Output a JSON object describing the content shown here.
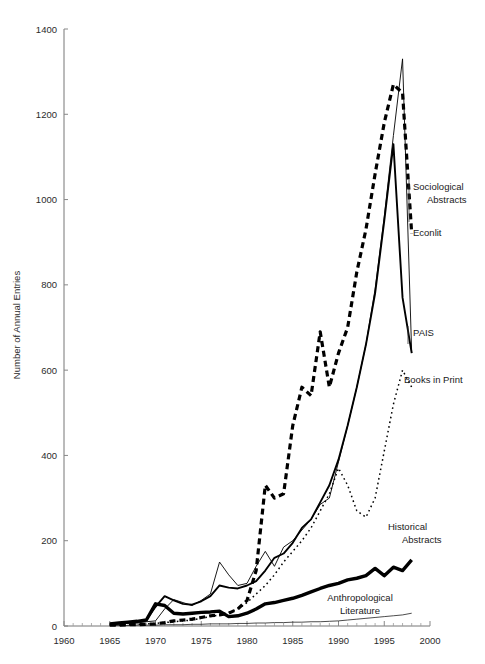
{
  "chart_data": {
    "type": "line",
    "title": "",
    "xlabel": "",
    "ylabel": "Number of Annual Entries",
    "xlim": [
      1960,
      2000
    ],
    "ylim": [
      0,
      1400
    ],
    "grid": false,
    "legend_position": "inline-right-labels",
    "x_ticks": [
      1960,
      1965,
      1970,
      1975,
      1980,
      1985,
      1990,
      1995,
      2000
    ],
    "x_tick_labels": [
      "1960",
      "1965",
      "1970",
      "1975",
      "1980",
      "1985",
      "1990",
      "1995",
      "2000"
    ],
    "x_minor_tick_interval": 1,
    "y_ticks": [
      0,
      200,
      400,
      600,
      800,
      1000,
      1200,
      1400
    ],
    "y_tick_labels": [
      "0",
      "200",
      "400",
      "600",
      "800",
      "1000",
      "1200",
      "1400"
    ],
    "series": [
      {
        "name": "Sociological Abstracts",
        "style": "thin-solid",
        "label_text_lines": [
          "Sociological",
          "Abstracts"
        ],
        "x": [
          1965,
          1966,
          1967,
          1968,
          1969,
          1970,
          1971,
          1972,
          1973,
          1974,
          1975,
          1976,
          1977,
          1978,
          1979,
          1980,
          1981,
          1982,
          1983,
          1984,
          1985,
          1986,
          1987,
          1988,
          1989,
          1990,
          1991,
          1992,
          1993,
          1994,
          1995,
          1996,
          1997,
          1998
        ],
        "values": [
          4,
          5,
          6,
          7,
          10,
          12,
          40,
          62,
          55,
          48,
          60,
          75,
          150,
          120,
          95,
          100,
          140,
          175,
          140,
          185,
          200,
          225,
          250,
          285,
          300,
          385,
          470,
          560,
          660,
          790,
          960,
          1150,
          1330,
          640
        ]
      },
      {
        "name": "Econlit",
        "style": "thick-dashed",
        "label_text_lines": [
          "Econlit"
        ],
        "x": [
          1965,
          1966,
          1967,
          1968,
          1969,
          1970,
          1971,
          1972,
          1973,
          1974,
          1975,
          1976,
          1977,
          1978,
          1979,
          1980,
          1981,
          1982,
          1983,
          1984,
          1985,
          1986,
          1987,
          1988,
          1989,
          1990,
          1991,
          1992,
          1993,
          1994,
          1995,
          1996,
          1997,
          1998
        ],
        "values": [
          2,
          2,
          3,
          3,
          4,
          5,
          8,
          12,
          14,
          16,
          20,
          24,
          26,
          30,
          40,
          60,
          130,
          330,
          300,
          310,
          470,
          560,
          540,
          690,
          560,
          640,
          700,
          830,
          930,
          1060,
          1180,
          1270,
          1250,
          920
        ]
      },
      {
        "name": "PAIS",
        "style": "thin-solid-2",
        "label_text_lines": [
          "PAIS"
        ],
        "x": [
          1965,
          1966,
          1967,
          1968,
          1969,
          1970,
          1971,
          1972,
          1973,
          1974,
          1975,
          1976,
          1977,
          1978,
          1979,
          1980,
          1981,
          1982,
          1983,
          1984,
          1985,
          1986,
          1987,
          1988,
          1989,
          1990,
          1991,
          1992,
          1993,
          1994,
          1995,
          1996,
          1997,
          1998
        ],
        "values": [
          5,
          6,
          8,
          10,
          14,
          45,
          70,
          60,
          52,
          50,
          58,
          70,
          95,
          90,
          88,
          95,
          105,
          130,
          160,
          170,
          195,
          230,
          250,
          290,
          330,
          390,
          470,
          560,
          660,
          780,
          950,
          1130,
          770,
          640
        ]
      },
      {
        "name": "Books in Print",
        "style": "fine-dotted",
        "label_text_lines": [
          "Books in Print"
        ],
        "x": [
          1965,
          1966,
          1967,
          1968,
          1969,
          1970,
          1971,
          1972,
          1973,
          1974,
          1975,
          1976,
          1977,
          1978,
          1979,
          1980,
          1981,
          1982,
          1983,
          1984,
          1985,
          1986,
          1987,
          1988,
          1989,
          1990,
          1991,
          1992,
          1993,
          1994,
          1995,
          1996,
          1997,
          1998
        ],
        "values": [
          2,
          2,
          3,
          4,
          5,
          6,
          8,
          10,
          12,
          14,
          18,
          22,
          26,
          32,
          40,
          55,
          75,
          95,
          120,
          150,
          175,
          200,
          230,
          270,
          310,
          370,
          330,
          270,
          255,
          300,
          410,
          520,
          600,
          560
        ]
      },
      {
        "name": "Historical Abstracts",
        "style": "very-thick-solid",
        "label_text_lines": [
          "Historical",
          "Abstracts"
        ],
        "x": [
          1965,
          1966,
          1967,
          1968,
          1969,
          1970,
          1971,
          1972,
          1973,
          1974,
          1975,
          1976,
          1977,
          1978,
          1979,
          1980,
          1981,
          1982,
          1983,
          1984,
          1985,
          1986,
          1987,
          1988,
          1989,
          1990,
          1991,
          1992,
          1993,
          1994,
          1995,
          1996,
          1997,
          1998
        ],
        "values": [
          5,
          7,
          9,
          11,
          14,
          52,
          48,
          30,
          28,
          30,
          32,
          33,
          35,
          22,
          24,
          30,
          40,
          52,
          55,
          60,
          65,
          72,
          80,
          88,
          95,
          100,
          108,
          112,
          118,
          135,
          118,
          138,
          130,
          155
        ]
      },
      {
        "name": "Anthropological Literature",
        "style": "hairline-solid",
        "label_text_lines": [
          "Anthropological",
          "Literature"
        ],
        "x": [
          1965,
          1966,
          1967,
          1968,
          1969,
          1970,
          1971,
          1972,
          1973,
          1974,
          1975,
          1976,
          1977,
          1978,
          1979,
          1980,
          1981,
          1982,
          1983,
          1984,
          1985,
          1986,
          1987,
          1988,
          1989,
          1990,
          1991,
          1992,
          1993,
          1994,
          1995,
          1996,
          1997,
          1998
        ],
        "values": [
          1,
          1,
          1,
          2,
          2,
          2,
          3,
          3,
          3,
          4,
          4,
          5,
          5,
          5,
          6,
          6,
          7,
          7,
          8,
          8,
          9,
          9,
          10,
          10,
          11,
          12,
          14,
          16,
          18,
          20,
          22,
          24,
          26,
          30
        ]
      }
    ]
  },
  "axes": {
    "y_axis_title": "Number of Annual Entries"
  },
  "annotations": [
    {
      "name": "sociological-abstracts-label",
      "lines": [
        "Sociological",
        "Abstracts"
      ]
    },
    {
      "name": "econlit-label",
      "lines": [
        "Econlit"
      ]
    },
    {
      "name": "pais-label",
      "lines": [
        "PAIS"
      ]
    },
    {
      "name": "books-in-print-label",
      "lines": [
        "Books in Print"
      ]
    },
    {
      "name": "historical-abstracts-label",
      "lines": [
        "Historical",
        "Abstracts"
      ]
    },
    {
      "name": "anthropological-literature-label",
      "lines": [
        "Anthropological",
        "Literature"
      ]
    }
  ],
  "colors": {
    "ink": "#000000",
    "axis": "#777777",
    "text": "#2b2b2b",
    "background": "#ffffff"
  }
}
